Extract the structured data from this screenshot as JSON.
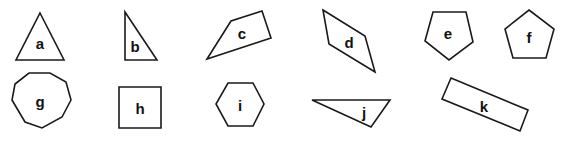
{
  "diagram": {
    "title": "",
    "stroke_color": "#1a1a1a",
    "fill_color": "#ffffff",
    "shapes": [
      {
        "label": "a",
        "type": "triangle",
        "points": "40,13 64,60 16,60",
        "label_pos": [
          40,
          43
        ]
      },
      {
        "label": "b",
        "type": "right-triangle",
        "points": "125,12 157,60 125,60",
        "label_pos": [
          135,
          46
        ]
      },
      {
        "label": "c",
        "type": "quadrilateral",
        "points": "207,59 231,21 262,11 271,38",
        "label_pos": [
          242,
          33
        ]
      },
      {
        "label": "d",
        "type": "quadrilateral",
        "points": "323,10 365,36 375,72 329,44",
        "label_pos": [
          349,
          42
        ]
      },
      {
        "label": "e",
        "type": "pentagon",
        "points": "433,12 466,12 473,42 449,60 425,41",
        "label_pos": [
          448,
          33
        ]
      },
      {
        "label": "f",
        "type": "pentagon",
        "points": "529,10 554,29 546,58 513,58 505,29",
        "label_pos": [
          529,
          37
        ]
      },
      {
        "label": "g",
        "type": "octagon",
        "points": "29,73 50,73 66,82 71,100 62,117 42,128 25,122 12,100 15,84",
        "label_pos": [
          40,
          101
        ]
      },
      {
        "label": "h",
        "type": "square",
        "points": "119,87 161,87 161,128 119,128",
        "label_pos": [
          140,
          108
        ]
      },
      {
        "label": "i",
        "type": "hexagon",
        "points": "228,83 253,83 264,104 253,126 228,126 216,104",
        "label_pos": [
          240,
          105
        ]
      },
      {
        "label": "j",
        "type": "scalene-triangle",
        "points": "312,100 390,100 371,127",
        "label_pos": [
          364,
          112
        ]
      },
      {
        "label": "k",
        "type": "rectangle",
        "points": "451,78 528,110 520,131 442,99",
        "label_pos": [
          484,
          106
        ]
      }
    ]
  }
}
